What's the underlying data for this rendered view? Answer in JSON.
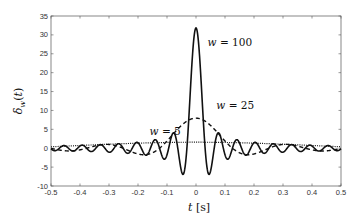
{
  "chart_data": {
    "type": "line",
    "title": "",
    "xlabel": "t [s]",
    "ylabel": "δ_w(t)",
    "xlim": [
      -0.5,
      0.5
    ],
    "ylim": [
      -10,
      35
    ],
    "grid": false,
    "legend": "none (inline annotations)",
    "x_ticks": [
      "-0.5",
      "-0.4",
      "-0.3",
      "-0.2",
      "-0.1",
      "0",
      "0.1",
      "0.2",
      "0.3",
      "0.4",
      "0.5"
    ],
    "y_ticks": [
      "-10",
      "-5",
      "0",
      "5",
      "10",
      "15",
      "20",
      "25",
      "30",
      "35"
    ],
    "function": "δ_w(t) = sin(w t) / (π t)",
    "series": [
      {
        "name": "w = 100",
        "w": 100,
        "style": "solid",
        "peak": 31.8,
        "min": -6.9
      },
      {
        "name": "w = 25",
        "w": 25,
        "style": "dashed",
        "peak": 7.96,
        "min": -1.73
      },
      {
        "name": "w = 5",
        "w": 5,
        "style": "dotted",
        "peak": 1.59,
        "min": 1.52
      }
    ],
    "annotations": [
      {
        "text": "w = 100",
        "x": 0.04,
        "y": 27
      },
      {
        "text": "w = 25",
        "x": 0.07,
        "y": 10.3
      },
      {
        "text": "w = 5",
        "x": -0.16,
        "y": 3.5
      }
    ]
  },
  "labels": {
    "xlabel_t": "t",
    "xlabel_unit": "[s]",
    "ylabel": "δw(t)",
    "ann_100": "w = 100",
    "ann_25": "w = 25",
    "ann_5": "w = 5"
  }
}
